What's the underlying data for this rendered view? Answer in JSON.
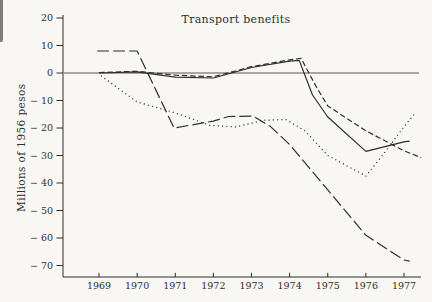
{
  "figure": {
    "paper_color": "#f8f7f4",
    "ink_color": "#2f2e2c"
  },
  "chart_data": {
    "type": "line",
    "title": "Transport benefits",
    "xlabel": "",
    "ylabel": "Millions of 1956 pesos",
    "grid": false,
    "legend": null,
    "zero_line": true,
    "ylim": [
      -74,
      21
    ],
    "xlim": [
      1968.1,
      1977.5
    ],
    "x_ticks": [
      {
        "v": 1969,
        "label": "1969"
      },
      {
        "v": 1970,
        "label": "1970"
      },
      {
        "v": 1971,
        "label": "1971"
      },
      {
        "v": 1972,
        "label": "1972"
      },
      {
        "v": 1973,
        "label": "1973"
      },
      {
        "v": 1974,
        "label": "1974"
      },
      {
        "v": 1975,
        "label": "1975"
      },
      {
        "v": 1976,
        "label": "1976"
      },
      {
        "v": 1977,
        "label": "1977"
      }
    ],
    "y_ticks": [
      {
        "v": 20,
        "label": "20"
      },
      {
        "v": 10,
        "label": "10"
      },
      {
        "v": 0,
        "label": "0"
      },
      {
        "v": -10,
        "label": "− 10"
      },
      {
        "v": -20,
        "label": "− 20"
      },
      {
        "v": -30,
        "label": "− 30"
      },
      {
        "v": -40,
        "label": "− 40"
      },
      {
        "v": -50,
        "label": "− 50"
      },
      {
        "v": -60,
        "label": "− 60"
      },
      {
        "v": -70,
        "label": "− 70"
      }
    ],
    "series": [
      {
        "name": "solid-line",
        "style": "solid",
        "points": [
          [
            1969,
            0
          ],
          [
            1970,
            0.4
          ],
          [
            1971,
            -1.5
          ],
          [
            1972,
            -1.8
          ],
          [
            1973,
            2
          ],
          [
            1974,
            4.3
          ],
          [
            1974.25,
            4.6
          ],
          [
            1974.6,
            -8
          ],
          [
            1975,
            -16
          ],
          [
            1976,
            -28.5
          ],
          [
            1977,
            -25
          ],
          [
            1977.15,
            -24.8
          ]
        ]
      },
      {
        "name": "short-dash-line",
        "style": "short-dash",
        "points": [
          [
            1969,
            0.2
          ],
          [
            1970,
            0.6
          ],
          [
            1971,
            -0.8
          ],
          [
            1972,
            -1.4
          ],
          [
            1973,
            2.3
          ],
          [
            1974,
            4.8
          ],
          [
            1974.3,
            5.3
          ],
          [
            1974.7,
            -5
          ],
          [
            1975,
            -12
          ],
          [
            1976,
            -21
          ],
          [
            1977,
            -28.3
          ],
          [
            1977.45,
            -30.8
          ]
        ]
      },
      {
        "name": "dotted-line",
        "style": "dotted",
        "points": [
          [
            1969.05,
            -1
          ],
          [
            1970,
            -10.5
          ],
          [
            1971,
            -14.5
          ],
          [
            1971.9,
            -19
          ],
          [
            1972.6,
            -19.6
          ],
          [
            1973.3,
            -17.2
          ],
          [
            1973.9,
            -16.9
          ],
          [
            1974.4,
            -21
          ],
          [
            1975,
            -30
          ],
          [
            1976,
            -37.5
          ],
          [
            1976.5,
            -28.8
          ],
          [
            1977,
            -19.5
          ],
          [
            1977.3,
            -14.5
          ]
        ]
      },
      {
        "name": "long-dash-line",
        "style": "long-dash",
        "points": [
          [
            1968.95,
            8
          ],
          [
            1970,
            8
          ],
          [
            1970.97,
            -20
          ],
          [
            1972,
            -17.5
          ],
          [
            1972.4,
            -15.8
          ],
          [
            1973.05,
            -15.7
          ],
          [
            1973.5,
            -19.5
          ],
          [
            1974,
            -26
          ],
          [
            1975,
            -42.5
          ],
          [
            1976,
            -59
          ],
          [
            1977,
            -68
          ],
          [
            1977.15,
            -68.4
          ]
        ]
      }
    ]
  }
}
